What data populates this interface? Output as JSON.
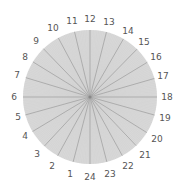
{
  "diagram": {
    "type": "radial-dial",
    "center": [
      90,
      97
    ],
    "radius": 67,
    "fill_color": "#d8d8d8",
    "spoke_color": "#a8a8a8",
    "fine_line_color": "#cfcfcf",
    "label_color": "#555555",
    "hour_labels": [
      {
        "text": "1",
        "x": 70,
        "y": 174
      },
      {
        "text": "2",
        "x": 52,
        "y": 166
      },
      {
        "text": "3",
        "x": 37,
        "y": 154
      },
      {
        "text": "4",
        "x": 25,
        "y": 136
      },
      {
        "text": "5",
        "x": 18,
        "y": 117
      },
      {
        "text": "6",
        "x": 14,
        "y": 97
      },
      {
        "text": "7",
        "x": 17,
        "y": 75
      },
      {
        "text": "8",
        "x": 25,
        "y": 57
      },
      {
        "text": "9",
        "x": 36,
        "y": 41
      },
      {
        "text": "10",
        "x": 53,
        "y": 28
      },
      {
        "text": "11",
        "x": 72,
        "y": 21
      },
      {
        "text": "12",
        "x": 90,
        "y": 19
      },
      {
        "text": "13",
        "x": 109,
        "y": 22
      },
      {
        "text": "14",
        "x": 128,
        "y": 31
      },
      {
        "text": "15",
        "x": 144,
        "y": 42
      },
      {
        "text": "16",
        "x": 156,
        "y": 57
      },
      {
        "text": "17",
        "x": 163,
        "y": 76
      },
      {
        "text": "18",
        "x": 167,
        "y": 97
      },
      {
        "text": "19",
        "x": 165,
        "y": 118
      },
      {
        "text": "20",
        "x": 157,
        "y": 139
      },
      {
        "text": "21",
        "x": 145,
        "y": 155
      },
      {
        "text": "22",
        "x": 128,
        "y": 166
      },
      {
        "text": "23",
        "x": 110,
        "y": 174
      },
      {
        "text": "24",
        "x": 90,
        "y": 177
      }
    ]
  }
}
